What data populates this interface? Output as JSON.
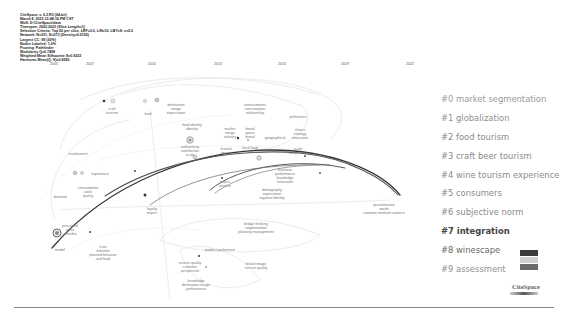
{
  "header": {
    "lines": [
      "CiteSpace, v. 6.2.R3 (64-bit)",
      "March 8, 2023 12:48:16 PM CST",
      "WoS: D:\\CiteSpace\\data",
      "Timespan: 2002-2022 (Slice Length=1)",
      "Selection Criteria: Top 50 per slice, LRF=3.0, L/N=10, LBY=8, e=2.0",
      "Network: N=331, E=573 (Density=0.0105)",
      "Largest CC: 98 (30%)",
      "Nodes Labeled: 1.0%",
      "Pruning: Pathfinder",
      "Modularity Q=0.7498",
      "Weighted Mean Silhouette S=0.9222",
      "Harmonic Mean(Q, S)=0.8283"
    ]
  },
  "timeline": {
    "years": [
      "2005",
      "2007",
      "2010",
      "2013",
      "2016",
      "2019",
      "2022"
    ]
  },
  "legend": {
    "clusters": [
      {
        "id": "#0",
        "label": "#0 market segmentation",
        "color": "#9a9a9a"
      },
      {
        "id": "#1",
        "label": "#1 globalization",
        "color": "#8f8f8f"
      },
      {
        "id": "#2",
        "label": "#2 food tourism",
        "color": "#8a8a8a"
      },
      {
        "id": "#3",
        "label": "#3 craft beer tourism",
        "color": "#8a8a8a"
      },
      {
        "id": "#4",
        "label": "#4 wine tourism experience",
        "color": "#8a8a8a"
      },
      {
        "id": "#5",
        "label": "#5 consumers",
        "color": "#8a8a8a"
      },
      {
        "id": "#6",
        "label": "#6 subjective norm",
        "color": "#8a8a8a"
      },
      {
        "id": "#7",
        "label": "#7 integration",
        "color": "#444444"
      },
      {
        "id": "#8",
        "label": "#8 winescape",
        "color": "#666666"
      },
      {
        "id": "#9",
        "label": "#9 assessment",
        "color": "#8f8f8f"
      }
    ]
  },
  "nodes": [
    {
      "label": "craft\ntourism",
      "x": 112,
      "y": 107
    },
    {
      "label": "food",
      "x": 148,
      "y": 112
    },
    {
      "label": "destination\nimage\nexpectation",
      "x": 176,
      "y": 103
    },
    {
      "label": "reenactments\nconsumption\nrelationship",
      "x": 255,
      "y": 103
    },
    {
      "label": "preference",
      "x": 298,
      "y": 115
    },
    {
      "label": "food identity\nidentity",
      "x": 192,
      "y": 123
    },
    {
      "label": "market\nimage\nindustry",
      "x": 230,
      "y": 127
    },
    {
      "label": "brand\nspace\nbrand",
      "x": 250,
      "y": 127
    },
    {
      "label": "geographical",
      "x": 275,
      "y": 136
    },
    {
      "label": "choice\nstrategy\ninnovation",
      "x": 300,
      "y": 128
    },
    {
      "label": "involvement",
      "x": 78,
      "y": 152
    },
    {
      "label": "authenticity\nsatisfaction\nscale",
      "x": 190,
      "y": 145
    },
    {
      "label": "festival\nimage",
      "x": 226,
      "y": 147
    },
    {
      "label": "local food\nfood",
      "x": 250,
      "y": 146
    },
    {
      "label": "scale\ncompetition",
      "x": 298,
      "y": 147
    },
    {
      "label": "experience",
      "x": 100,
      "y": 172
    },
    {
      "label": "consumption\nvalue\nquality",
      "x": 88,
      "y": 186
    },
    {
      "label": "business\nperformance\nknowledge\ninnovation",
      "x": 285,
      "y": 168
    },
    {
      "label": "demand",
      "x": 60,
      "y": 195
    },
    {
      "label": "impact\nservice",
      "x": 225,
      "y": 180
    },
    {
      "label": "demography\nexpectation\nregional identity",
      "x": 272,
      "y": 188
    },
    {
      "label": "loyalty\nimpact",
      "x": 152,
      "y": 207
    },
    {
      "label": "questionnaire\nwords\ncommon method variance",
      "x": 384,
      "y": 203
    },
    {
      "label": "perceived\nvalue\nattitudes",
      "x": 70,
      "y": 224
    },
    {
      "label": "bridge thinking\nsegmentation\nplanning management",
      "x": 256,
      "y": 222
    },
    {
      "label": "model",
      "x": 60,
      "y": 248
    },
    {
      "label": "trust\nintention\nplanned behavior\nand food",
      "x": 103,
      "y": 245
    },
    {
      "label": "product preference",
      "x": 220,
      "y": 248
    },
    {
      "label": "service quality\ncustomer\nperspective",
      "x": 190,
      "y": 261
    },
    {
      "label": "knowledge\ndestination image\nperformance",
      "x": 196,
      "y": 279
    },
    {
      "label": "brand image\nservice quality",
      "x": 256,
      "y": 262
    }
  ],
  "colorbar": {
    "swatches": [
      "#3a3a3a",
      "#cfcfcf",
      "#6a6a6a"
    ]
  },
  "logo": {
    "text": "CiteSpace"
  }
}
